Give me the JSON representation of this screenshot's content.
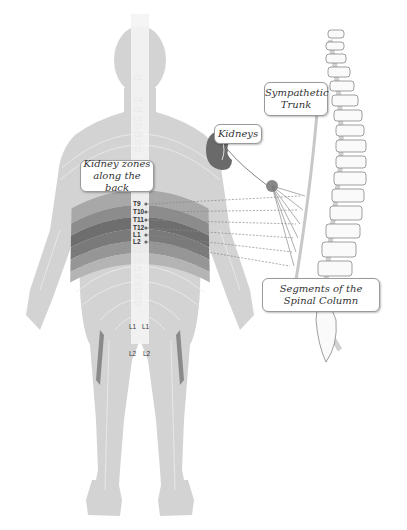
{
  "diagram": {
    "labels": {
      "kidney_zones": [
        "Kidney zones",
        "along the back"
      ],
      "kidneys": "Kidneys",
      "sympathetic_trunk": [
        "Sympathetic",
        "Trunk"
      ],
      "segments": [
        "Segments of the",
        "Spinal Column"
      ]
    },
    "highlighted_segments": [
      "T9",
      "T10",
      "T11",
      "T12",
      "L1",
      "L2"
    ],
    "faint_segments": [
      "L3",
      "L4",
      "L5",
      "S1",
      "S2",
      "S3",
      "S4",
      "S5"
    ],
    "upper_faint_segments": [
      "C2",
      "C4",
      "C5",
      "C6",
      "C7",
      "C8",
      "T1",
      "T2"
    ],
    "leg_labels": {
      "left_l1": "L1",
      "right_l1": "L1",
      "left_l2": "L2",
      "right_l2": "L2"
    },
    "colors": {
      "body": "#d3d3d3",
      "zone_dark": "#6e6e6e",
      "zone_mid": "#9a9a9a",
      "lines": "#888888",
      "spine_outline": "#777777"
    }
  }
}
